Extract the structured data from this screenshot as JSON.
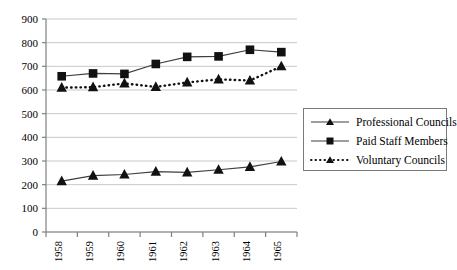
{
  "chart_data": {
    "type": "line",
    "title": "",
    "xlabel": "",
    "ylabel": "",
    "categories": [
      "1958",
      "1959",
      "1960",
      "1961",
      "1962",
      "1963",
      "1964",
      "1965"
    ],
    "ylim": [
      0,
      900
    ],
    "ytick_values": [
      0,
      100,
      200,
      300,
      400,
      500,
      600,
      700,
      800,
      900
    ],
    "ytick_labels": [
      "0",
      "100",
      "200",
      "300",
      "400",
      "500",
      "600",
      "700",
      "800",
      "900"
    ],
    "grid": true,
    "grid_axis": "y",
    "legend_position": "right",
    "series": [
      {
        "name": "Professional Councils",
        "marker": "triangle",
        "line_style": "solid",
        "color": "#000000",
        "values": [
          215,
          238,
          243,
          255,
          252,
          263,
          275,
          298
        ]
      },
      {
        "name": "Paid Staff Members",
        "marker": "square",
        "line_style": "solid",
        "color": "#000000",
        "values": [
          658,
          670,
          668,
          710,
          740,
          742,
          770,
          760
        ]
      },
      {
        "name": "Voluntary Councils",
        "marker": "triangle",
        "line_style": "dotted",
        "color": "#000000",
        "values": [
          610,
          612,
          628,
          613,
          632,
          645,
          640,
          700
        ]
      }
    ]
  },
  "legend": {
    "items": [
      {
        "label": "Professional Councils",
        "key": "solid-line-triangle-marker"
      },
      {
        "label": "Paid Staff Members",
        "key": "solid-line-square-marker"
      },
      {
        "label": "Voluntary Councils",
        "key": "dotted-line-triangle-marker"
      }
    ]
  },
  "colors": {
    "line": "#3f3f3f",
    "marker": "#111111",
    "grid": "#c9c9c9",
    "axis": "#808080",
    "legend_border": "#7a7a7a"
  }
}
